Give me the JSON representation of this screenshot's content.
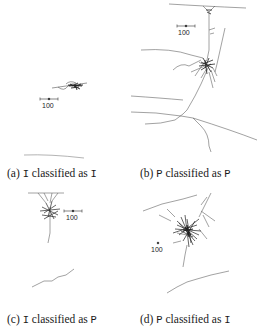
{
  "figure": {
    "panels": [
      {
        "id": "a",
        "label_prefix": "(a)",
        "true_class": "I",
        "word": "classified as",
        "predicted_class": "P",
        "scale_bar_label": "100"
      },
      {
        "id": "b",
        "label_prefix": "(b)",
        "true_class": "P",
        "word": "classified as",
        "predicted_class": "P",
        "scale_bar_label": "100"
      },
      {
        "id": "c",
        "label_prefix": "(c)",
        "true_class": "I",
        "word": "classified as",
        "predicted_class": "P",
        "scale_bar_label": "100"
      },
      {
        "id": "d",
        "label_prefix": "(d)",
        "true_class": "P",
        "word": "classified as",
        "predicted_class": "I",
        "scale_bar_label": "100"
      }
    ],
    "colors": {
      "neuron_stroke": "#555555",
      "neuron_dense": "#222222",
      "text": "#1a1a1a"
    }
  }
}
